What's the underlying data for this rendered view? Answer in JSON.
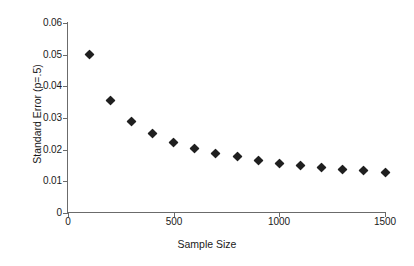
{
  "chart_data": {
    "type": "scatter",
    "title": "",
    "xlabel": "Sample Size",
    "ylabel": "Standard Error (p=.5)",
    "xlim": [
      0,
      1500
    ],
    "ylim": [
      0,
      0.06
    ],
    "grid": false,
    "legend": null,
    "x_ticks": [
      "0",
      "500",
      "1000",
      "1500"
    ],
    "x_tick_values": [
      0,
      500,
      1000,
      1500
    ],
    "y_ticks": [
      "0",
      "0.01",
      "0.02",
      "0.03",
      "0.04",
      "0.05",
      "0.06"
    ],
    "y_tick_values": [
      0,
      0.01,
      0.02,
      0.03,
      0.04,
      0.05,
      0.06
    ],
    "marker": "filled-diamond",
    "marker_color": "#1f1f1f",
    "axis_color": "#6b6b6b",
    "x": [
      100,
      200,
      300,
      400,
      500,
      600,
      700,
      800,
      900,
      1000,
      1100,
      1200,
      1300,
      1400,
      1500
    ],
    "values": [
      0.05,
      0.0354,
      0.0289,
      0.025,
      0.0224,
      0.0204,
      0.0189,
      0.0177,
      0.0167,
      0.0158,
      0.0151,
      0.0144,
      0.0139,
      0.0134,
      0.0129
    ],
    "series": [
      {
        "name": "Standard Error",
        "values": [
          0.05,
          0.0354,
          0.0289,
          0.025,
          0.0224,
          0.0204,
          0.0189,
          0.0177,
          0.0167,
          0.0158,
          0.0151,
          0.0144,
          0.0139,
          0.0134,
          0.0129
        ]
      }
    ]
  }
}
